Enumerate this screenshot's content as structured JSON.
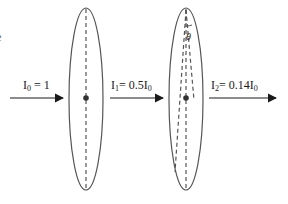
{
  "diagram": {
    "type": "polarizer-sequence",
    "edge_fragment": "e",
    "labels": {
      "i0": {
        "symbol": "I",
        "sub": "0",
        "rest": " = 1"
      },
      "i1": {
        "symbol": "I",
        "sub": "1",
        "rest": "= 0.5I",
        "rest_sub": "0"
      },
      "i2": {
        "symbol": "I",
        "sub": "2",
        "rest": "= 0.14I",
        "rest_sub": "0"
      }
    },
    "angle_label": "θ",
    "polarizers": [
      {
        "name": "polarizer-1",
        "axis": "vertical"
      },
      {
        "name": "polarizer-2",
        "axis": "tilted by θ from vertical"
      }
    ],
    "colors": {
      "stroke": "#555555",
      "arrow": "#1a1a1a",
      "text": "#1a1a1a"
    }
  }
}
